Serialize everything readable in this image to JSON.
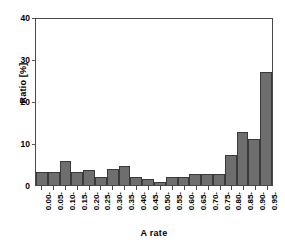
{
  "chart_data": {
    "type": "bar",
    "title": "",
    "xlabel": "A rate",
    "ylabel": "Ratio [%]",
    "categories": [
      "0.00-",
      "0.05-",
      "0.10-",
      "0.15-",
      "0.20-",
      "0.25-",
      "0.30-",
      "0.35-",
      "0.40-",
      "0.45-",
      "0.50-",
      "0.55-",
      "0.60-",
      "0.65-",
      "0.70-",
      "0.75-",
      "0.80-",
      "0.85-",
      "0.90-",
      "0.95-"
    ],
    "values": [
      3.1,
      3.1,
      5.8,
      3.2,
      3.7,
      1.9,
      3.9,
      4.5,
      2.0,
      1.4,
      0.8,
      2.0,
      2.0,
      2.6,
      2.6,
      2.6,
      7.3,
      12.7,
      11.0,
      27.2
    ],
    "ylim": [
      0,
      40
    ],
    "yticks": [
      0,
      10,
      20,
      30,
      40
    ],
    "ytick_labels": [
      "0",
      "10",
      "20",
      "30",
      "40"
    ],
    "grid": false,
    "legend": false,
    "bar_color": "#6e6e6e",
    "bar_edge_color": "#3a3a3a",
    "axis_color": "#4a4a4a",
    "background": "#ffffff"
  }
}
